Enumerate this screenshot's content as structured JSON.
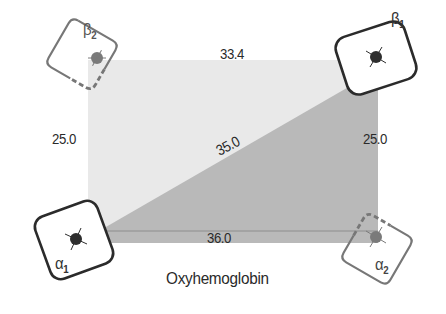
{
  "title": "Oxyhemoglobin",
  "distances": {
    "top": "33.4",
    "left": "25.0",
    "right": "25.0",
    "diagonal": "35.0",
    "bottom": "36.0"
  },
  "subunits": [
    {
      "id": "beta2",
      "greek": "β",
      "sub": "2",
      "outline": "dashed-partial"
    },
    {
      "id": "beta1",
      "greek": "β",
      "sub": "1",
      "outline": "solid"
    },
    {
      "id": "alpha1",
      "greek": "α",
      "sub": "1",
      "outline": "solid"
    },
    {
      "id": "alpha2",
      "greek": "α",
      "sub": "2",
      "outline": "dashed-partial"
    }
  ],
  "colors": {
    "upper_triangle": "#e9e9e9",
    "lower_triangle": "#b9b9b9",
    "outline_dark": "#2b2b2b",
    "outline_gray": "#707070",
    "heme_dark": "#2e2e2e",
    "heme_gray": "#7a7a7a"
  }
}
